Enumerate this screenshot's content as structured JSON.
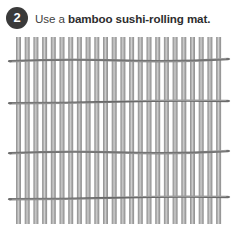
{
  "step": {
    "number": "2",
    "text_plain": "Use a bamboo sushi-rolling mat.",
    "text_light": "Use a ",
    "text_bold": "bamboo sushi-rolling mat."
  },
  "illustration": {
    "name": "bamboo-sushi-rolling-mat",
    "slat_count": 24,
    "string_count": 4,
    "colors": {
      "slat_dark": "#9a9a9a",
      "slat_light": "#c9c9c9",
      "slat_edge": "#8b8b8b",
      "string": "#6e6e6e",
      "badge": "#3a3a3a",
      "badge_text": "#ffffff",
      "text": "#3f3f3f",
      "background": "#ffffff"
    },
    "geometry": {
      "mat_left": 16,
      "mat_right": 222,
      "slat_top": 37,
      "slat_bottom": 224,
      "slat_width": 5,
      "slat_pitch": 8.7,
      "string_y": [
        60,
        102,
        152,
        198
      ],
      "string_thickness": 2.4,
      "knot_overhang": 6
    }
  }
}
